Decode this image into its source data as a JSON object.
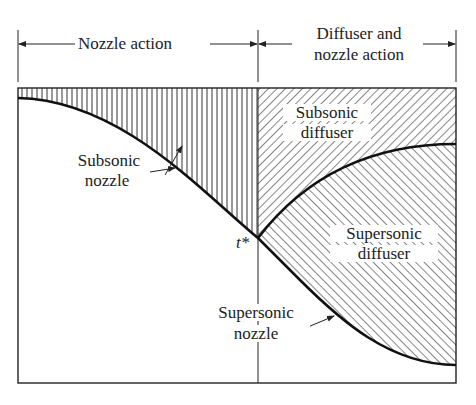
{
  "header": {
    "left_span_label": "Nozzle action",
    "right_span_label_line1": "Diffuser and",
    "right_span_label_line2": "nozzle action"
  },
  "regions": {
    "subsonic_nozzle": {
      "line1": "Subsonic",
      "line2": "nozzle"
    },
    "subsonic_diffuser": {
      "line1": "Subsonic",
      "line2": "diffuser"
    },
    "supersonic_diffuser": {
      "line1": "Supersonic",
      "line2": "diffuser"
    },
    "supersonic_nozzle": {
      "line1": "Supersonic",
      "line2": "nozzle"
    }
  },
  "throat_label": "t*",
  "colors": {
    "ink": "#222222",
    "background": "#ffffff"
  }
}
